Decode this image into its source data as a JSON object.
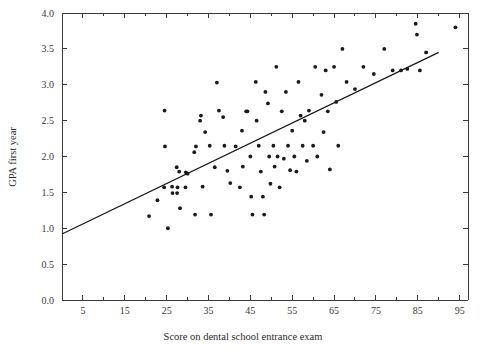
{
  "chart_data": {
    "type": "scatter",
    "title": "",
    "xlabel": "Score on dental school entrance exam",
    "ylabel": "GPA first year",
    "xlim": [
      0,
      97
    ],
    "ylim": [
      0,
      4.0
    ],
    "grid": false,
    "legend": "none",
    "x_ticks_major": [
      5,
      15,
      25,
      35,
      45,
      55,
      65,
      75,
      85,
      95
    ],
    "x_tick_labels": [
      "5",
      "15",
      "25",
      "35",
      "45",
      "55",
      "65",
      "75",
      "85",
      "95"
    ],
    "x_ticks_minor": [
      0,
      10,
      20,
      30,
      40,
      50,
      60,
      70,
      80,
      90
    ],
    "y_ticks": [
      0.0,
      0.5,
      1.0,
      1.5,
      2.0,
      2.5,
      3.0,
      3.5,
      4.0
    ],
    "y_tick_labels": [
      "0.0",
      "0.5",
      "1.0",
      "1.5",
      "2.0",
      "2.5",
      "3.0",
      "3.5",
      "4.0"
    ],
    "point_color": "#1a1a1a",
    "line_color": "#1a1a1a",
    "axis_color": "#3a3a3a",
    "trend_line": {
      "label": "least-squares regression line",
      "x_start": 0,
      "y_start": 0.92,
      "x_end": 90,
      "y_end": 3.45
    },
    "points": [
      [
        24.5,
        2.64
      ],
      [
        24.6,
        2.14
      ],
      [
        24.4,
        1.57
      ],
      [
        25.3,
        1.0
      ],
      [
        26.3,
        1.58
      ],
      [
        26.4,
        1.49
      ],
      [
        27.5,
        1.49
      ],
      [
        27.6,
        1.57
      ],
      [
        27.4,
        1.85
      ],
      [
        28.0,
        1.79
      ],
      [
        28.2,
        1.28
      ],
      [
        29.5,
        1.57
      ],
      [
        29.6,
        1.78
      ],
      [
        30.0,
        1.76
      ],
      [
        22.8,
        1.39
      ],
      [
        20.8,
        1.17
      ],
      [
        31.6,
        2.06
      ],
      [
        31.8,
        1.19
      ],
      [
        32.0,
        2.14
      ],
      [
        33.6,
        1.58
      ],
      [
        34.2,
        2.34
      ],
      [
        35.3,
        2.15
      ],
      [
        35.6,
        1.19
      ],
      [
        33.0,
        2.5
      ],
      [
        33.2,
        2.57
      ],
      [
        36.5,
        1.85
      ],
      [
        37.0,
        3.03
      ],
      [
        37.5,
        2.64
      ],
      [
        38.5,
        2.55
      ],
      [
        38.8,
        2.15
      ],
      [
        39.5,
        1.8
      ],
      [
        40.2,
        1.63
      ],
      [
        41.5,
        2.14
      ],
      [
        42.5,
        1.57
      ],
      [
        43.0,
        2.36
      ],
      [
        43.2,
        1.86
      ],
      [
        44.0,
        2.63
      ],
      [
        44.3,
        2.63
      ],
      [
        45.0,
        2.0
      ],
      [
        45.2,
        1.44
      ],
      [
        45.5,
        1.19
      ],
      [
        46.3,
        3.04
      ],
      [
        46.5,
        2.5
      ],
      [
        47.0,
        2.15
      ],
      [
        47.5,
        1.79
      ],
      [
        48.0,
        1.44
      ],
      [
        48.3,
        1.19
      ],
      [
        48.6,
        2.9
      ],
      [
        49.2,
        2.74
      ],
      [
        49.5,
        2.0
      ],
      [
        49.8,
        1.62
      ],
      [
        50.5,
        2.15
      ],
      [
        50.8,
        1.86
      ],
      [
        51.2,
        3.25
      ],
      [
        51.5,
        2.0
      ],
      [
        52.0,
        1.57
      ],
      [
        52.5,
        2.63
      ],
      [
        53.0,
        1.97
      ],
      [
        53.5,
        2.9
      ],
      [
        54.0,
        2.15
      ],
      [
        54.5,
        1.81
      ],
      [
        55.0,
        2.36
      ],
      [
        55.5,
        2.0
      ],
      [
        56.0,
        1.79
      ],
      [
        56.5,
        3.04
      ],
      [
        57.0,
        2.57
      ],
      [
        57.5,
        2.15
      ],
      [
        58.0,
        2.5
      ],
      [
        58.5,
        1.94
      ],
      [
        59.0,
        2.64
      ],
      [
        60.0,
        2.15
      ],
      [
        60.5,
        3.25
      ],
      [
        61.0,
        2.0
      ],
      [
        62.0,
        2.86
      ],
      [
        62.5,
        2.34
      ],
      [
        63.0,
        3.2
      ],
      [
        63.5,
        2.63
      ],
      [
        64.0,
        1.82
      ],
      [
        65.0,
        3.25
      ],
      [
        65.5,
        2.76
      ],
      [
        66.0,
        2.15
      ],
      [
        67.0,
        3.5
      ],
      [
        68.0,
        3.04
      ],
      [
        70.0,
        2.94
      ],
      [
        72.0,
        3.25
      ],
      [
        74.5,
        3.15
      ],
      [
        77.0,
        3.5
      ],
      [
        79.0,
        3.2
      ],
      [
        81.0,
        3.2
      ],
      [
        82.5,
        3.22
      ],
      [
        84.5,
        3.85
      ],
      [
        84.8,
        3.7
      ],
      [
        85.5,
        3.2
      ],
      [
        87.0,
        3.45
      ],
      [
        94.0,
        3.8
      ]
    ]
  }
}
